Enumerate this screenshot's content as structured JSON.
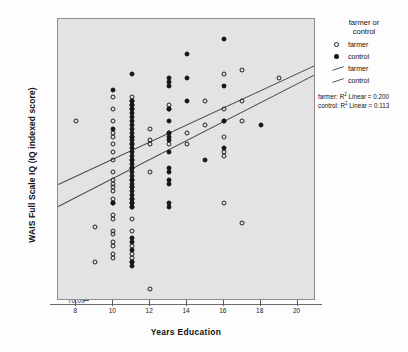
{
  "chart_data": {
    "type": "scatter",
    "title": "",
    "xlabel": "Years Education",
    "ylabel": "WAIS Full Scale IQ (IQ indexed score)",
    "xlim": [
      7,
      21
    ],
    "ylim": [
      70,
      142
    ],
    "xticks": [
      8,
      10,
      12,
      14,
      16,
      18,
      20
    ],
    "xtick_labels": [
      "8",
      "10",
      "12",
      "14",
      "16",
      "18",
      "20"
    ],
    "yticks": [
      70,
      80,
      90,
      100,
      110,
      120,
      130,
      140
    ],
    "ytick_labels": [
      "70.00",
      "80.00",
      "90.00",
      "100.00",
      "110.00",
      "120.00",
      "130.00",
      "140.00"
    ],
    "grid": false,
    "legend_position": "right",
    "background": "#e3e3e3",
    "series": [
      {
        "name": "farmer",
        "marker": "open-circle",
        "color": "#202020",
        "points": [
          [
            8,
            116
          ],
          [
            9,
            89
          ],
          [
            9,
            80
          ],
          [
            10,
            122
          ],
          [
            10,
            119
          ],
          [
            10,
            116
          ],
          [
            10,
            113
          ],
          [
            10,
            112
          ],
          [
            10,
            110
          ],
          [
            10,
            108
          ],
          [
            10,
            106
          ],
          [
            10,
            103
          ],
          [
            10,
            101
          ],
          [
            10,
            100
          ],
          [
            10,
            99
          ],
          [
            10,
            98
          ],
          [
            10,
            96
          ],
          [
            10,
            95
          ],
          [
            10,
            92
          ],
          [
            10,
            91
          ],
          [
            10,
            88
          ],
          [
            10,
            87
          ],
          [
            10,
            85
          ],
          [
            10,
            84
          ],
          [
            10,
            82
          ],
          [
            10,
            81
          ],
          [
            11,
            122
          ],
          [
            11,
            121
          ],
          [
            11,
            120
          ],
          [
            11,
            119
          ],
          [
            11,
            112
          ],
          [
            11,
            110
          ],
          [
            11,
            106
          ],
          [
            11,
            104
          ],
          [
            11,
            101
          ],
          [
            11,
            99
          ],
          [
            11,
            96
          ],
          [
            11,
            95
          ],
          [
            11,
            94
          ],
          [
            11,
            91
          ],
          [
            11,
            88
          ],
          [
            11,
            84
          ],
          [
            11,
            82
          ],
          [
            11,
            81
          ],
          [
            11,
            80
          ],
          [
            12,
            114
          ],
          [
            12,
            111
          ],
          [
            12,
            110
          ],
          [
            12,
            103
          ],
          [
            12,
            73
          ],
          [
            13,
            120
          ],
          [
            13,
            119
          ],
          [
            13,
            113
          ],
          [
            13,
            110
          ],
          [
            14,
            113
          ],
          [
            14,
            110
          ],
          [
            15,
            121
          ],
          [
            15,
            115
          ],
          [
            16,
            128
          ],
          [
            16,
            119
          ],
          [
            16,
            116
          ],
          [
            16,
            112
          ],
          [
            16,
            108
          ],
          [
            16,
            107
          ],
          [
            16,
            95
          ],
          [
            17,
            129
          ],
          [
            17,
            121
          ],
          [
            17,
            116
          ],
          [
            17,
            90
          ],
          [
            19,
            127
          ]
        ]
      },
      {
        "name": "control",
        "marker": "filled-circle",
        "color": "#151515",
        "points": [
          [
            10,
            124
          ],
          [
            10,
            114
          ],
          [
            10,
            95
          ],
          [
            11,
            128
          ],
          [
            11,
            121
          ],
          [
            11,
            120
          ],
          [
            11,
            119
          ],
          [
            11,
            118
          ],
          [
            11,
            117
          ],
          [
            11,
            116
          ],
          [
            11,
            115
          ],
          [
            11,
            114
          ],
          [
            11,
            113
          ],
          [
            11,
            112
          ],
          [
            11,
            111
          ],
          [
            11,
            110
          ],
          [
            11,
            109
          ],
          [
            11,
            108
          ],
          [
            11,
            107
          ],
          [
            11,
            106
          ],
          [
            11,
            105
          ],
          [
            11,
            104
          ],
          [
            11,
            103
          ],
          [
            11,
            102
          ],
          [
            11,
            101
          ],
          [
            11,
            100
          ],
          [
            11,
            99
          ],
          [
            11,
            98
          ],
          [
            11,
            97
          ],
          [
            11,
            96
          ],
          [
            11,
            95
          ],
          [
            11,
            94
          ],
          [
            11,
            86
          ],
          [
            11,
            85
          ],
          [
            11,
            83
          ],
          [
            11,
            80
          ],
          [
            11,
            79
          ],
          [
            13,
            127
          ],
          [
            13,
            126
          ],
          [
            13,
            125
          ],
          [
            13,
            119
          ],
          [
            13,
            116
          ],
          [
            13,
            113
          ],
          [
            13,
            112
          ],
          [
            13,
            111
          ],
          [
            13,
            108
          ],
          [
            13,
            104
          ],
          [
            13,
            103
          ],
          [
            13,
            101
          ],
          [
            13,
            100
          ],
          [
            13,
            95
          ],
          [
            13,
            94
          ],
          [
            14,
            133
          ],
          [
            14,
            127
          ],
          [
            14,
            121
          ],
          [
            15,
            106
          ],
          [
            16,
            137
          ],
          [
            16,
            125
          ],
          [
            16,
            116
          ],
          [
            16,
            109
          ],
          [
            18,
            115
          ]
        ]
      }
    ],
    "fit_lines": [
      {
        "name": "farmer",
        "x0": 7,
        "y0": 100,
        "x1": 21,
        "y1": 130.5
      },
      {
        "name": "control",
        "x0": 7,
        "y0": 94.2,
        "x1": 21,
        "y1": 128.0
      }
    ]
  },
  "legend": {
    "title": "farmer or\ncontrol",
    "title_line1": "farmer or",
    "title_line2": "control",
    "entries": [
      {
        "label": "farmer",
        "symbol": "open-circle"
      },
      {
        "label": "control",
        "symbol": "filled-circle"
      },
      {
        "label": "farmer",
        "symbol": "line"
      },
      {
        "label": "control",
        "symbol": "line"
      }
    ]
  },
  "annotations": {
    "farmer_r2_prefix": "farmer: R",
    "farmer_r2_suffix": " Linear = 0.200",
    "control_r2_prefix": "control: R",
    "control_r2_suffix": " Linear = 0.113",
    "superscript": "2"
  }
}
